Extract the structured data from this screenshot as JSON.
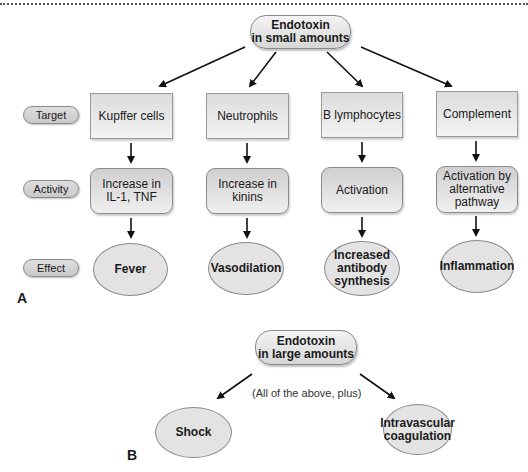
{
  "panel_a": {
    "letter": "A",
    "source": {
      "line1": "Endotoxin",
      "line2": "in small amounts"
    },
    "row_labels": {
      "target": "Target",
      "activity": "Activity",
      "effect": "Effect"
    },
    "columns": [
      {
        "target": "Kupffer cells",
        "activity": [
          "Increase in",
          "IL-1, TNF"
        ],
        "effect": [
          "Fever"
        ]
      },
      {
        "target": "Neutrophils",
        "activity": [
          "Increase in",
          "kinins"
        ],
        "effect": [
          "Vasodilation"
        ]
      },
      {
        "target": "B lymphocytes",
        "activity": [
          "Activation"
        ],
        "effect": [
          "Increased",
          "antibody",
          "synthesis"
        ]
      },
      {
        "target": "Complement",
        "activity": [
          "Activation by",
          "alternative",
          "pathway"
        ],
        "effect": [
          "Inflammation"
        ]
      }
    ]
  },
  "panel_b": {
    "letter": "B",
    "source": {
      "line1": "Endotoxin",
      "line2": "in large amounts"
    },
    "note": "(All of the above, plus)",
    "effects": [
      {
        "lines": [
          "Shock"
        ]
      },
      {
        "lines": [
          "Intravascular",
          "coagulation"
        ]
      }
    ]
  },
  "colors": {
    "node_fill": "#e3e3e3",
    "node_border": "#8a8a8a",
    "arrow": "#111111"
  }
}
